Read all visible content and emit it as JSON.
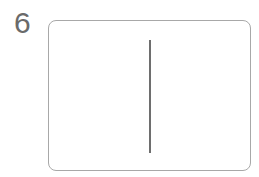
{
  "figure": {
    "label": "6",
    "line_color": "#6e6e6e",
    "border_color": "#a8a8a8"
  }
}
